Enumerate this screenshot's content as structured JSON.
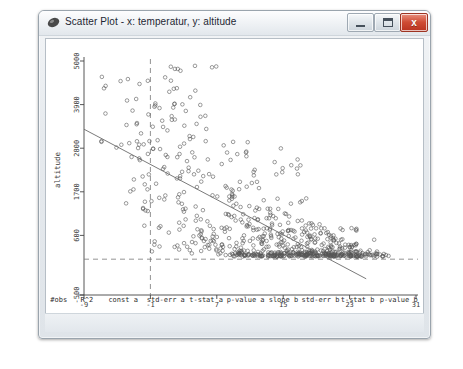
{
  "window": {
    "title": "Scatter Plot - x: temperatur, y: altitude",
    "icon": "app-plot-icon",
    "minimize_label": "",
    "maximize_label": "",
    "close_label": "x"
  },
  "chart_data": {
    "type": "scatter",
    "title": "",
    "xlabel": "temperature",
    "ylabel": "altitude",
    "xlim": [
      -9,
      31
    ],
    "ylim": [
      -500,
      5000
    ],
    "xticks": [
      -9,
      -1,
      7,
      15,
      23,
      31
    ],
    "yticks": [
      -500,
      600,
      1700,
      2800,
      3900,
      5000
    ],
    "grid": false,
    "marker": "open-circle",
    "marker_color": "#555555",
    "reference_lines": [
      {
        "orientation": "vertical",
        "value": -1,
        "style": "dashed"
      },
      {
        "orientation": "horizontal",
        "value": 0,
        "style": "dashed"
      }
    ],
    "fit_line": {
      "label": "least-squares fit",
      "intercept": 2280,
      "slope": -111,
      "x_start": -9,
      "x_end": 25,
      "style": "solid",
      "color": "#6b6b6b"
    },
    "points_note": "726 observations; dense cluster near altitude 0 for temperature 10-27"
  },
  "stats": {
    "headers": [
      "#obs",
      "R^2",
      "const a",
      "std-err a",
      "t-stat a",
      "p-value a",
      "slope b",
      "std-err b",
      "t-stat b",
      "p-value b"
    ],
    "values": [
      "726",
      "0.362",
      "2.28e+003",
      "73.1",
      "31.2",
      "0",
      "-111",
      "5.49",
      "-20.3",
      "8.17e-073"
    ]
  }
}
